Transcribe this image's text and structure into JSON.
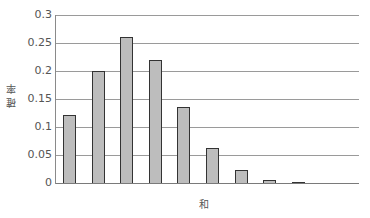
{
  "chart_data": {
    "type": "bar",
    "title": "",
    "xlabel": "和",
    "ylabel": "確率",
    "categories": [
      "1",
      "2",
      "3",
      "4",
      "5",
      "6",
      "7",
      "8",
      "9"
    ],
    "values": [
      0.121,
      0.2,
      0.26,
      0.22,
      0.135,
      0.062,
      0.024,
      0.006,
      0.001
    ],
    "ylim": [
      0,
      0.3
    ],
    "yticks": [
      "0",
      "0.05",
      "0.1",
      "0.15",
      "0.2",
      "0.25",
      "0.3"
    ],
    "ytick_values": [
      0,
      0.05,
      0.1,
      0.15,
      0.2,
      0.25,
      0.3
    ],
    "grid": true,
    "legend": null,
    "colors": {
      "bar_fill": "#bdbdbd",
      "bar_edge": "#333333",
      "grid": "#9a9a9a"
    }
  },
  "labels": {
    "x_axis": "和",
    "y_axis": "確率"
  }
}
